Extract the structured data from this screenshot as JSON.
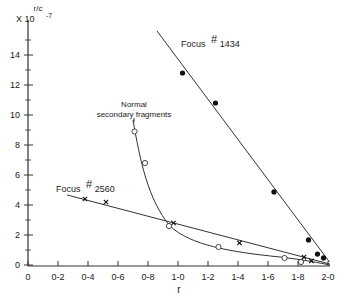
{
  "chart_data": {
    "type": "scatter",
    "title": "",
    "xlabel": "r",
    "ylabel": "r/c",
    "ylabel_scale": "X 10",
    "ylabel_exponent": "-7",
    "xlim": [
      0,
      2.0
    ],
    "ylim": [
      0,
      15.5
    ],
    "grid": false,
    "x_ticks": [
      {
        "v": 0,
        "label": "0"
      },
      {
        "v": 0.2,
        "label": "0-2"
      },
      {
        "v": 0.4,
        "label": "0-4"
      },
      {
        "v": 0.6,
        "label": "0-6"
      },
      {
        "v": 0.8,
        "label": "0-8"
      },
      {
        "v": 1.0,
        "label": "1-0"
      },
      {
        "v": 1.2,
        "label": "1-2"
      },
      {
        "v": 1.4,
        "label": "1-4"
      },
      {
        "v": 1.6,
        "label": "1-6"
      },
      {
        "v": 1.8,
        "label": "1-8"
      },
      {
        "v": 2.0,
        "label": "2-0"
      }
    ],
    "y_ticks": [
      {
        "v": 0,
        "label": "0"
      },
      {
        "v": 2,
        "label": "2"
      },
      {
        "v": 4,
        "label": "4"
      },
      {
        "v": 6,
        "label": "6"
      },
      {
        "v": 8,
        "label": "8"
      },
      {
        "v": 10,
        "label": "10"
      },
      {
        "v": 12,
        "label": "12"
      },
      {
        "v": 14,
        "label": "14"
      }
    ],
    "series": [
      {
        "name": "Focus #1434",
        "label_text": "Focus",
        "label_hash": "#",
        "label_num": "1434",
        "marker": "filled-circle",
        "points": [
          [
            1.03,
            12.8
          ],
          [
            1.25,
            10.8
          ],
          [
            1.64,
            4.87
          ],
          [
            1.87,
            1.67
          ],
          [
            1.93,
            0.73
          ],
          [
            1.97,
            0.47
          ]
        ],
        "fit_line": [
          [
            0.86,
            15.6
          ],
          [
            2.01,
            0.2
          ]
        ]
      },
      {
        "name": "Focus #2560",
        "label_text": "Focus",
        "label_hash": "#",
        "label_num": "2560",
        "marker": "x",
        "points": [
          [
            0.38,
            4.4
          ],
          [
            0.52,
            4.2
          ],
          [
            0.97,
            2.8
          ],
          [
            1.41,
            1.47
          ],
          [
            1.84,
            0.53
          ],
          [
            1.89,
            0.27
          ]
        ],
        "fit_line": [
          [
            0.26,
            4.67
          ],
          [
            2.01,
            0.07
          ]
        ]
      },
      {
        "name": "Normal secondary fragments",
        "label_line1": "Normal",
        "label_line2": "secondary fragments",
        "marker": "open-circle",
        "points": [
          [
            0.71,
            8.9
          ],
          [
            0.78,
            6.8
          ],
          [
            0.94,
            2.6
          ],
          [
            1.27,
            1.2
          ],
          [
            1.71,
            0.47
          ],
          [
            1.82,
            0.2
          ]
        ],
        "curve": true
      }
    ]
  }
}
